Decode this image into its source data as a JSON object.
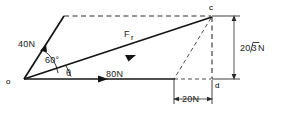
{
  "diagram": {
    "background_color": "#ffffff",
    "line_color": "#141414",
    "points": {
      "origin": "o",
      "resultant_tip": "c",
      "foot": "d"
    },
    "vectors": [
      {
        "name": "force-40n",
        "label": "40N",
        "magnitude": 40,
        "unit": "N",
        "angle_deg": 60,
        "style": "solid"
      },
      {
        "name": "force-80n",
        "label": "80N",
        "magnitude": 80,
        "unit": "N",
        "angle_deg": 0,
        "style": "solid"
      },
      {
        "name": "resultant",
        "label": "F",
        "sublabel": "r",
        "style": "solid"
      }
    ],
    "angles": [
      {
        "name": "angle-60",
        "label": "60°",
        "value": 60
      },
      {
        "name": "angle-theta",
        "label": "θ",
        "value": null
      }
    ],
    "dimensions": [
      {
        "name": "vertical-dimension",
        "label": "20√3N",
        "prefix": "20",
        "radical": "√",
        "radicand": "3",
        "suffix": "N",
        "orientation": "vertical"
      },
      {
        "name": "horizontal-dimension",
        "label": "20N",
        "value": 20,
        "unit": "N",
        "orientation": "horizontal"
      }
    ]
  }
}
